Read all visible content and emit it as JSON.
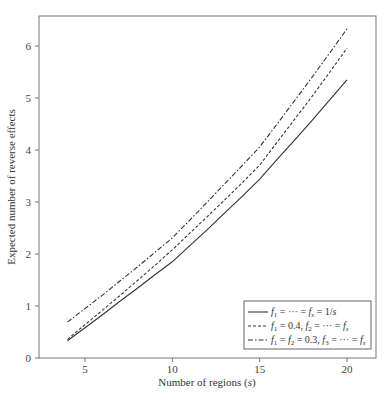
{
  "chart_data": {
    "type": "line",
    "title": "",
    "xlabel": "Number of regions (s)",
    "ylabel": "Expected number of reverse effects",
    "xlim": [
      3.0,
      21.3
    ],
    "ylim": [
      0,
      6.6
    ],
    "xticks": [
      5,
      10,
      15,
      20
    ],
    "yticks": [
      0,
      1,
      2,
      3,
      4,
      5,
      6
    ],
    "grid": false,
    "legend_position": "lower right",
    "x": [
      4,
      5,
      6,
      7,
      8,
      9,
      10,
      11,
      12,
      13,
      14,
      15,
      16,
      17,
      18,
      19,
      20
    ],
    "series": [
      {
        "name": "f1 = ··· = fs = 1/s",
        "style": "solid",
        "values": [
          0.33,
          0.58,
          0.83,
          1.09,
          1.34,
          1.6,
          1.85,
          2.16,
          2.47,
          2.79,
          3.11,
          3.44,
          3.82,
          4.19,
          4.57,
          4.96,
          5.35
        ]
      },
      {
        "name": "f1 = 0.4, f2 = ··· = fs",
        "style": "dashed",
        "values": [
          0.36,
          0.64,
          0.92,
          1.2,
          1.49,
          1.78,
          2.08,
          2.4,
          2.72,
          3.04,
          3.37,
          3.71,
          4.15,
          4.59,
          5.03,
          5.49,
          5.96
        ]
      },
      {
        "name": "f1 = f2 = 0.3, f3 = ··· = fs",
        "style": "dashdot",
        "values": [
          0.69,
          0.95,
          1.21,
          1.48,
          1.75,
          2.03,
          2.31,
          2.65,
          3.0,
          3.35,
          3.7,
          4.06,
          4.5,
          4.95,
          5.4,
          5.86,
          6.33
        ]
      }
    ]
  },
  "axes": {
    "xlabel_main": "Number of regions (",
    "xlabel_var": "s",
    "xlabel_close": ")",
    "ylabel": "Expected number of reverse effects",
    "xtick_labels": [
      "5",
      "10",
      "15",
      "20"
    ],
    "ytick_labels": [
      "0",
      "1",
      "2",
      "3",
      "4",
      "5",
      "6"
    ]
  },
  "legend": {
    "entries": [
      {
        "style": "solid",
        "text": "f1 = ··· = fs = 1/s"
      },
      {
        "style": "dashed",
        "text": "f1 = 0.4, f2 = ··· = fs"
      },
      {
        "style": "dashdot",
        "text": "f1 = f2 = 0.3, f3 = ··· = fs"
      }
    ]
  },
  "colors": {
    "line": "#333333",
    "axis": "#666666",
    "frame": "#777777"
  }
}
